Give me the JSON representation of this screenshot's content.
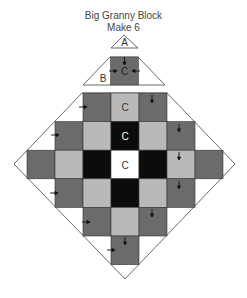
{
  "title": "Big Granny Block",
  "subtitle": "Make 6",
  "pieces": {
    "a_label": "A",
    "b_label": "B",
    "c_label": "C"
  },
  "colors": {
    "dark": "#6b6b6b",
    "light": "#b9b9b9",
    "black": "#0c0c0c",
    "white": "#ffffff",
    "outline": "#555555"
  },
  "grid": {
    "rows": [
      [
        "",
        "",
        "dark",
        "light",
        "dark",
        "",
        ""
      ],
      [
        "",
        "dark",
        "light",
        "black",
        "light",
        "dark",
        ""
      ],
      [
        "dark",
        "light",
        "black",
        "white",
        "black",
        "light",
        "dark"
      ],
      [
        "",
        "dark",
        "light",
        "black",
        "light",
        "dark",
        ""
      ],
      [
        "",
        "",
        "dark",
        "light",
        "dark",
        "",
        ""
      ],
      [
        "",
        "",
        "",
        "dark",
        "",
        "",
        ""
      ]
    ],
    "labeled_cells": [
      {
        "row": 0,
        "col": 3,
        "label": "C"
      },
      {
        "row": 1,
        "col": 3,
        "label": "C"
      },
      {
        "row": 2,
        "col": 3,
        "label": "C"
      }
    ]
  }
}
